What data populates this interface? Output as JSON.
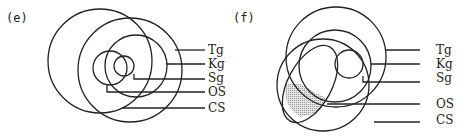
{
  "panels": [
    {
      "id": "e",
      "tag": "(e)",
      "labels": [
        "Tg",
        "Kg",
        "Sg",
        "OS",
        "CS"
      ]
    },
    {
      "id": "f",
      "tag": "(f)",
      "labels": [
        "Tg",
        "Kg",
        "Sg",
        "OS",
        "CS"
      ],
      "shaded_region_color": "#d0d0d0"
    }
  ]
}
